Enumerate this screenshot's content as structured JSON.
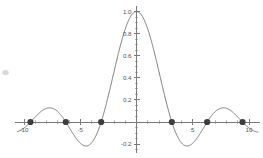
{
  "chart_data": {
    "type": "line",
    "title": "",
    "subtitle": "",
    "xlabel": "",
    "ylabel": "",
    "function": "sin(x)/x",
    "xlim": [
      -10.8,
      11.0
    ],
    "ylim": [
      -0.28,
      1.05
    ],
    "grid": false,
    "legend": null,
    "x_ticks_major": [
      -10,
      -5,
      5,
      10
    ],
    "x_tick_labels": [
      "-10",
      "-5",
      "5",
      "10"
    ],
    "x_ticks_minor": [
      -9,
      -8,
      -7,
      -6,
      -4,
      -3,
      -2,
      -1,
      1,
      2,
      3,
      4,
      6,
      7,
      8,
      9
    ],
    "y_ticks_major": [
      -0.2,
      0.2,
      0.4,
      0.6,
      0.8,
      1.0
    ],
    "y_tick_labels": [
      "-0.2",
      "0.2",
      "0.4",
      "0.6",
      "0.8",
      "1.0"
    ],
    "y_ticks_minor": [
      -0.25,
      -0.15,
      -0.1,
      -0.05,
      0.05,
      0.1,
      0.15,
      0.25,
      0.3,
      0.35,
      0.45,
      0.5,
      0.55,
      0.65,
      0.7,
      0.75,
      0.85,
      0.9,
      0.95
    ],
    "series": [
      {
        "name": "sin(x)/x",
        "color": "#6b6b6b",
        "x_start": -10.6,
        "x_end": 10.8,
        "samples": 900
      }
    ],
    "marked_points": [
      {
        "x": -9.4248,
        "y": 0,
        "label": "-3pi"
      },
      {
        "x": -6.2832,
        "y": 0,
        "label": "-2pi"
      },
      {
        "x": -3.1416,
        "y": 0,
        "label": "-pi"
      },
      {
        "x": 3.1416,
        "y": 0,
        "label": "pi"
      },
      {
        "x": 6.2832,
        "y": 0,
        "label": "2pi"
      },
      {
        "x": 9.4248,
        "y": 0,
        "label": "3pi"
      }
    ],
    "marker_color": "#3d3d3d",
    "marker_radius": 3.1,
    "axis_color": "#7a7a7a",
    "background_color": "#ffffff"
  },
  "annotations": {
    "smudge_present": true
  }
}
